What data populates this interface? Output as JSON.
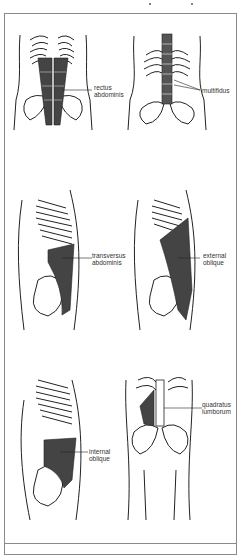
{
  "figures": [
    {
      "id": "rectus-abdominis",
      "label_line1": "rectus",
      "label_line2": "abdominis",
      "view": "anterior"
    },
    {
      "id": "multifidus",
      "label_line1": "multifidus",
      "label_line2": "",
      "view": "posterior"
    },
    {
      "id": "transversus-abdominis",
      "label_line1": "transversus",
      "label_line2": "abdominis",
      "view": "lateral"
    },
    {
      "id": "external-oblique",
      "label_line1": "external",
      "label_line2": "oblique",
      "view": "lateral"
    },
    {
      "id": "internal-oblique",
      "label_line1": "internal",
      "label_line2": "oblique",
      "view": "lateral"
    },
    {
      "id": "quadratus-lumborum",
      "label_line1": "quadratus",
      "label_line2": "lumborum",
      "view": "anterior"
    }
  ],
  "colors": {
    "line": "#222222",
    "muscle": "#3a3a3a",
    "frame": "#8a8a8a",
    "bg": "#ffffff"
  }
}
